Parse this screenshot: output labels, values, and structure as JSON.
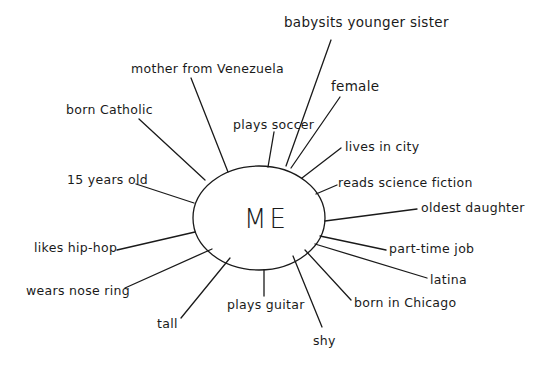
{
  "diagram": {
    "type": "identity-web",
    "center": {
      "label": "ME"
    },
    "spokes": [
      {
        "label": "babysits younger sister",
        "x": 284,
        "y": 12
      },
      {
        "label": "mother from Venezuela",
        "x": 131,
        "y": 67
      },
      {
        "label": "female",
        "x": 330,
        "y": 80
      },
      {
        "label": "born Catholic",
        "x": 66,
        "y": 104
      },
      {
        "label": "plays soccer",
        "x": 233,
        "y": 118
      },
      {
        "label": "lives in city",
        "x": 344,
        "y": 139
      },
      {
        "label": "15 years old",
        "x": 68,
        "y": 174
      },
      {
        "label": "reads science fiction",
        "x": 338,
        "y": 176
      },
      {
        "label": "oldest daughter",
        "x": 421,
        "y": 202
      },
      {
        "label": "likes hip-hop",
        "x": 34,
        "y": 242
      },
      {
        "label": "part-time job",
        "x": 389,
        "y": 242
      },
      {
        "label": "wears nose ring",
        "x": 27,
        "y": 286
      },
      {
        "label": "latina",
        "x": 430,
        "y": 273
      },
      {
        "label": "plays guitar",
        "x": 228,
        "y": 297
      },
      {
        "label": "born in Chicago",
        "x": 354,
        "y": 295
      },
      {
        "label": "tall",
        "x": 157,
        "y": 318
      },
      {
        "label": "shy",
        "x": 314,
        "y": 334
      }
    ]
  }
}
